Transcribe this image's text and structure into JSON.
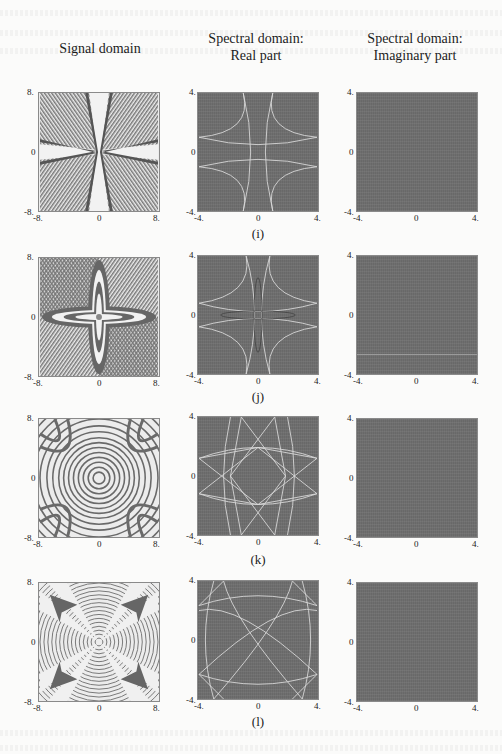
{
  "figure": {
    "column_headers": [
      {
        "line1": "Signal domain",
        "line2": ""
      },
      {
        "line1": "Spectral domain:",
        "line2": "Real part"
      },
      {
        "line1": "Spectral domain:",
        "line2": "Imaginary part"
      }
    ],
    "signal_axis": {
      "min": "-8.",
      "mid": "0",
      "max": "8."
    },
    "spectral_axis": {
      "min": "-4.",
      "mid": "0",
      "max": "4."
    },
    "rows": [
      {
        "caption": "(i)"
      },
      {
        "caption": "(j)"
      },
      {
        "caption": "(k)"
      },
      {
        "caption": "(l)"
      }
    ],
    "colors": {
      "spectral_background": "#6f6f6f",
      "curve_color": "#d8d8d8",
      "signal_dark": "#6a6a6a",
      "signal_light": "#f0f0f0"
    }
  }
}
